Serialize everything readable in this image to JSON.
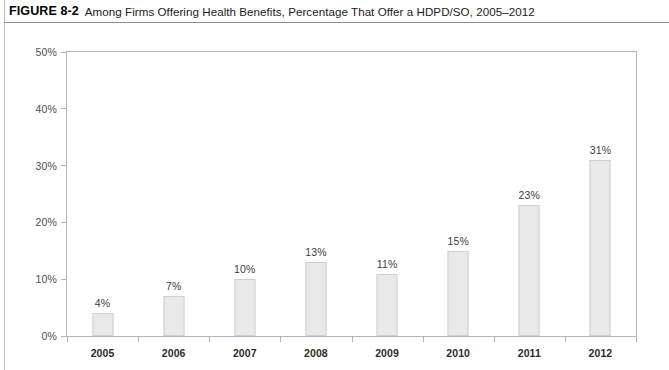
{
  "figure": {
    "number": "FIGURE 8-2",
    "title": "Among Firms Offering Health Benefits, Percentage That Offer a HDPD/SO, 2005–2012"
  },
  "chart_data": {
    "type": "bar",
    "title": "Among Firms Offering Health Benefits, Percentage That Offer a HDPD/SO, 2005–2012",
    "xlabel": "",
    "ylabel": "",
    "categories": [
      "2005",
      "2006",
      "2007",
      "2008",
      "2009",
      "2010",
      "2011",
      "2012"
    ],
    "values": [
      4,
      7,
      10,
      13,
      11,
      15,
      23,
      31
    ],
    "data_labels": [
      "4%",
      "7%",
      "10%",
      "13%",
      "11%",
      "15%",
      "23%",
      "31%"
    ],
    "ylim": [
      0,
      50
    ],
    "ytick_values": [
      0,
      10,
      20,
      30,
      40,
      50
    ],
    "ytick_labels": [
      "0%",
      "10%",
      "20%",
      "30%",
      "40%",
      "50%"
    ],
    "grid": false,
    "legend": null,
    "bar_color": "#e9e9e9",
    "bar_border_color": "#cfcfcf",
    "axis_color": "#b5b5b5",
    "text_color": "#3d3d3d"
  }
}
